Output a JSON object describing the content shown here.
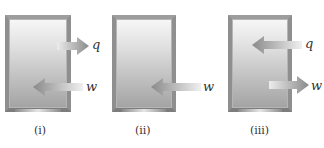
{
  "figure": {
    "colors": {
      "frame": "#8f8f8f",
      "arrow_dark": "#8a8a8a",
      "arrow_light": "#e8e8e8",
      "text": "#333333"
    },
    "panels": [
      {
        "label": "(i)",
        "arrows": [
          {
            "symbol": "q",
            "direction": "out"
          },
          {
            "symbol": "w",
            "direction": "in"
          }
        ]
      },
      {
        "label": "(ii)",
        "arrows": [
          {
            "symbol": "w",
            "direction": "in"
          }
        ]
      },
      {
        "label": "(iii)",
        "arrows": [
          {
            "symbol": "q",
            "direction": "in"
          },
          {
            "symbol": "w",
            "direction": "out"
          }
        ]
      }
    ]
  }
}
